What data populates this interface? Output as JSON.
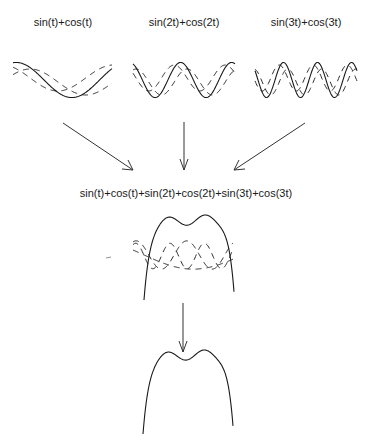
{
  "diagram": {
    "components": [
      {
        "id": "c1",
        "label": "sin(t)+cos(t)",
        "frequency": 1,
        "expression": "sin(t)+cos(t)"
      },
      {
        "id": "c2",
        "label": "sin(2t)+cos(2t)",
        "frequency": 2,
        "expression": "sin(2t)+cos(2t)"
      },
      {
        "id": "c3",
        "label": "sin(3t)+cos(3t)",
        "frequency": 3,
        "expression": "sin(3t)+cos(3t)"
      }
    ],
    "sum": {
      "label": "sin(t)+cos(t)+sin(2t)+cos(2t)+sin(3t)+cos(3t)",
      "minima_count": 3,
      "maxima_count": 2
    },
    "legend": {
      "solid": "combined signal",
      "dashed": "sin and cos components"
    },
    "arrows": [
      {
        "from": "c1",
        "to": "sum",
        "direction": "down-right"
      },
      {
        "from": "c2",
        "to": "sum",
        "direction": "down"
      },
      {
        "from": "c3",
        "to": "sum",
        "direction": "down-left"
      },
      {
        "from": "sum",
        "to": "result",
        "direction": "down"
      }
    ],
    "colors": {
      "ink": "#1a1a1a",
      "background": "#ffffff"
    }
  }
}
